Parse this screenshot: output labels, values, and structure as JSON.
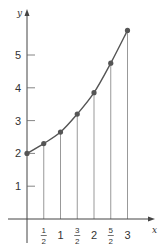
{
  "chart_data": {
    "type": "line",
    "title": "",
    "xlabel": "x",
    "ylabel": "y",
    "x_ticks": [
      "1/2",
      "1",
      "3/2",
      "2",
      "5/2",
      "3"
    ],
    "y_ticks": [
      "1",
      "2",
      "3",
      "4",
      "5"
    ],
    "x": [
      0,
      0.5,
      1,
      1.5,
      2,
      2.5,
      3
    ],
    "series": [
      {
        "name": "curve",
        "values": [
          2.0,
          2.3,
          2.65,
          3.2,
          3.85,
          4.75,
          5.75
        ]
      }
    ],
    "xlim": [
      -0.75,
      3.9
    ],
    "ylim": [
      -0.9,
      6.0
    ],
    "grid": false,
    "legend": "none",
    "annotations": "vertical lines drawn from each data point down to the x-axis"
  },
  "axes": {
    "x_label": "x",
    "y_label": "y"
  },
  "style": {
    "curve_color": "#555555",
    "axis_color": "#444444",
    "drop_line_color": "#999999"
  }
}
